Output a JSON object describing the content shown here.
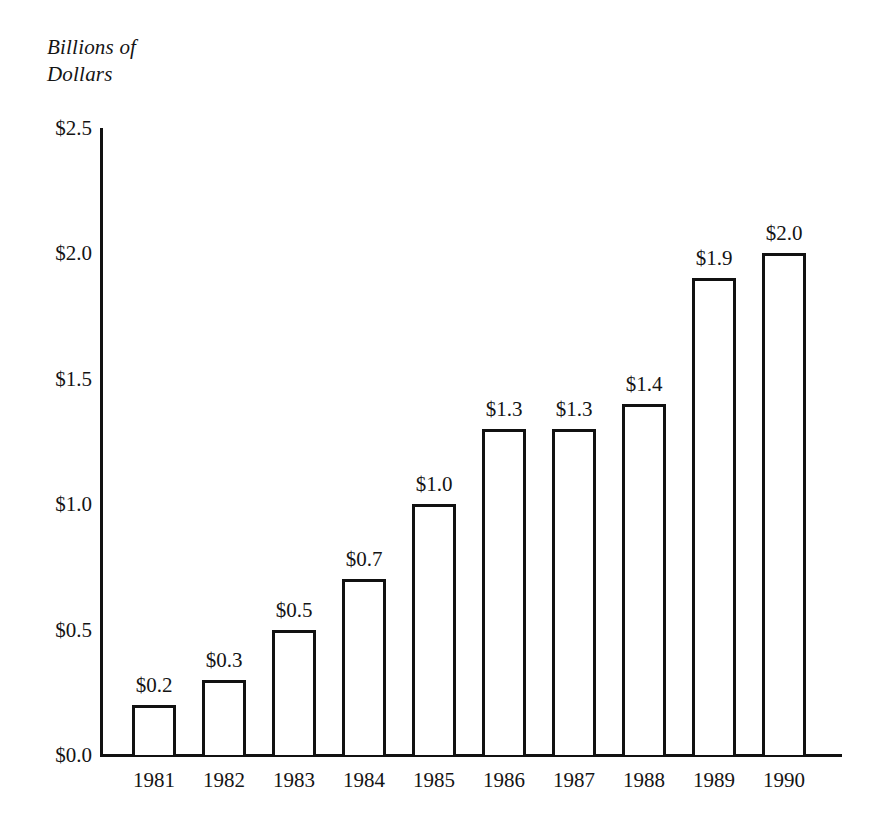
{
  "chart_data": {
    "type": "bar",
    "title": "",
    "subtitle": "",
    "ylabel": "Billions of\nDollars",
    "xlabel": "",
    "categories": [
      "1981",
      "1982",
      "1983",
      "1984",
      "1985",
      "1986",
      "1987",
      "1988",
      "1989",
      "1990"
    ],
    "values": [
      0.2,
      0.3,
      0.5,
      0.7,
      1.0,
      1.3,
      1.3,
      1.4,
      1.9,
      2.0
    ],
    "data_labels": [
      "$0.2",
      "$0.3",
      "$0.5",
      "$0.7",
      "$1.0",
      "$1.3",
      "$1.3",
      "$1.4",
      "$1.9",
      "$2.0"
    ],
    "ylim": [
      0.0,
      2.5
    ],
    "ytick_values": [
      0.0,
      0.5,
      1.0,
      1.5,
      2.0,
      2.5
    ],
    "ytick_labels": [
      "$0.0",
      "$0.5",
      "$1.0",
      "$1.5",
      "$2.0",
      "$2.5"
    ],
    "grid": false,
    "legend": null,
    "bar_fill": "#ffffff",
    "bar_edge": "#111111",
    "background": "#ffffff",
    "text_color": "#141414"
  }
}
